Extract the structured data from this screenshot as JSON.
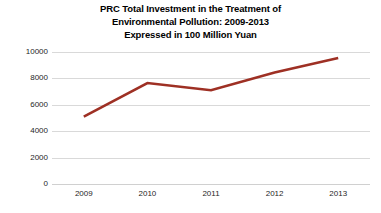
{
  "chart_data": {
    "type": "line",
    "title": "PRC Total Investment in the Treatment of Environmental Pollution: 2009-2013 Expressed in 100 Million Yuan",
    "title_lines": [
      "PRC Total Investment in the Treatment of",
      "Environmental Pollution: 2009-2013",
      "Expressed in 100 Million Yuan"
    ],
    "categories": [
      "2009",
      "2010",
      "2011",
      "2012",
      "2013"
    ],
    "values": [
      5100,
      7650,
      7100,
      8450,
      9550
    ],
    "series": [
      {
        "name": "Total Investment",
        "values": [
          5100,
          7650,
          7100,
          8450,
          9550
        ],
        "color": "#9E3024"
      }
    ],
    "xlabel": "",
    "ylabel": "",
    "ylim": [
      0,
      10000
    ],
    "yticks": [
      0,
      2000,
      4000,
      6000,
      8000,
      10000
    ],
    "ytick_labels": [
      "0",
      "2000",
      "4000",
      "6000",
      "8000",
      "10000"
    ],
    "grid": "horizontal",
    "legend": "none",
    "background_color": "#FFFFFF",
    "gridline_color": "#D9D9D9",
    "tick_label_color": "#262626"
  }
}
